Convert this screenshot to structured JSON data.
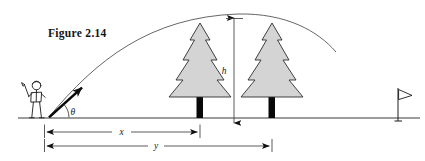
{
  "figure": {
    "caption": "Figure 2.14",
    "domain": "physics-projectile-motion-diagram",
    "background_color": "#ffffff"
  },
  "labels": {
    "angle": "θ",
    "height": "h",
    "distance_x": "x",
    "distance_y": "y"
  },
  "colors": {
    "ink": "#1a1a1a",
    "tree_fill": "#d4d4d4",
    "tree_outline": "#2c2c2c",
    "trunk": "#080808",
    "ground": "#3a3a3a",
    "trajectory": "#555555",
    "dimension": "#3d3d3d"
  },
  "scene": {
    "ground_y": 118,
    "tee_x": 48,
    "trajectory": {
      "start": [
        48,
        118
      ],
      "apex": [
        240,
        14
      ],
      "end": [
        336,
        52
      ]
    },
    "launch_arrow": {
      "from": [
        48,
        118
      ],
      "to": [
        85,
        85
      ],
      "angle_label": "θ"
    },
    "golfer": {
      "x": 26,
      "y": 80,
      "description": "stick-figure golfer swinging a club"
    },
    "trees": [
      {
        "id": "tree-near",
        "trunk_x": 200,
        "apex_y": 23,
        "half_width": 34
      },
      {
        "id": "tree-far",
        "trunk_x": 272,
        "apex_y": 23,
        "half_width": 34
      }
    ],
    "flag": {
      "pole_x": 398,
      "top_y": 88
    },
    "dimensions": [
      {
        "id": "height-h",
        "label": "h",
        "orientation": "vertical",
        "x": 234,
        "from_y": 23,
        "to_y": 118
      },
      {
        "id": "distance-x",
        "label": "x",
        "orientation": "horizontal",
        "y": 132,
        "from_x": 44,
        "to_x": 200
      },
      {
        "id": "distance-y",
        "label": "y",
        "orientation": "horizontal",
        "y": 146,
        "from_x": 44,
        "to_x": 272
      }
    ]
  }
}
